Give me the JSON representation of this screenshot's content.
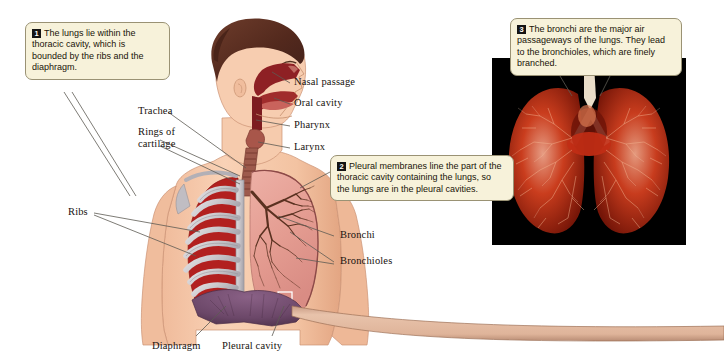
{
  "figure": {
    "background_color": "#ffffff"
  },
  "callouts": [
    {
      "number": "1",
      "text": "The lungs lie within the thoracic cavity, which is bounded by the ribs and the diaphragm.",
      "box_color": "#f7f2da",
      "badge_color": "#141414"
    },
    {
      "number": "2",
      "text": "Pleural membranes line the part of the thoracic cavity containing the lungs, so the lungs are in the pleural cavities.",
      "box_color": "#f7f2da",
      "badge_color": "#141414"
    },
    {
      "number": "3",
      "text": "The bronchi are the major air passageways of the lungs.  They lead to the bronchioles, which are finely branched.",
      "box_color": "#f7f2da",
      "badge_color": "#141414"
    }
  ],
  "labels": {
    "nasal_passage": "Nasal passage",
    "oral_cavity": "Oral cavity",
    "pharynx": "Pharynx",
    "larynx": "Larynx",
    "trachea": "Trachea",
    "rings_of_cartilage": "Rings of cartilage",
    "ribs": "Ribs",
    "bronchi": "Bronchi",
    "bronchioles": "Bronchioles",
    "diaphragm": "Diaphragm",
    "pleural_cavity": "Pleural cavity"
  },
  "photo_inset": {
    "caption_ref": "3",
    "subject": "resin cast of bronchial tree",
    "background_color": "#000000",
    "cast_color": "#d2371d"
  },
  "palette": {
    "skin": "#f6c9ab",
    "skin_shadow": "#e4a483",
    "hair": "#5c3226",
    "bone": "#cfcdd0",
    "rib_muscle": "#b81f22",
    "lung_pink": "#e9a79c",
    "bronchial_tree": "#5a3120",
    "diaphragm": "#6e4a6b",
    "cavity_red": "#8e2024",
    "leader_line": "#5d5b53",
    "connector_band": "#e0b49a"
  }
}
